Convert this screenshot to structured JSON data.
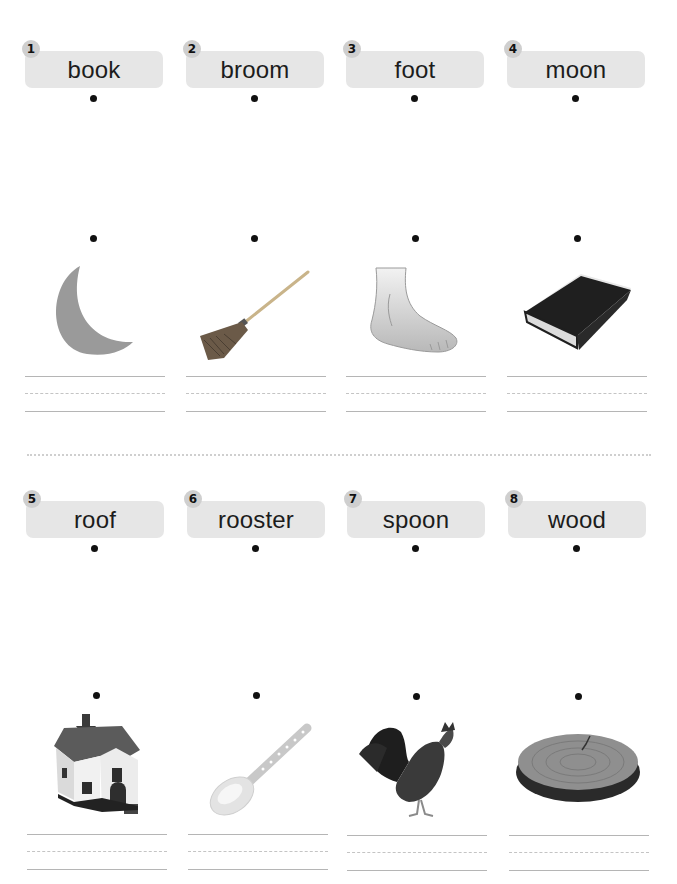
{
  "worksheet": {
    "row1": {
      "words": [
        {
          "number": "1",
          "word": "book"
        },
        {
          "number": "2",
          "word": "broom"
        },
        {
          "number": "3",
          "word": "foot"
        },
        {
          "number": "4",
          "word": "moon"
        }
      ],
      "pictures": [
        "moon-image",
        "broom-image",
        "foot-image",
        "book-image"
      ]
    },
    "row2": {
      "words": [
        {
          "number": "5",
          "word": "roof"
        },
        {
          "number": "6",
          "word": "rooster"
        },
        {
          "number": "7",
          "word": "spoon"
        },
        {
          "number": "8",
          "word": "wood"
        }
      ],
      "pictures": [
        "house-roof-image",
        "spoon-image",
        "rooster-image",
        "wood-slice-image"
      ]
    }
  },
  "colors": {
    "label_background": "#e6e6e6",
    "badge_background": "#cfcfcf",
    "moon_gray": "#9a9a9a",
    "line_gray": "#b5b5b5"
  }
}
